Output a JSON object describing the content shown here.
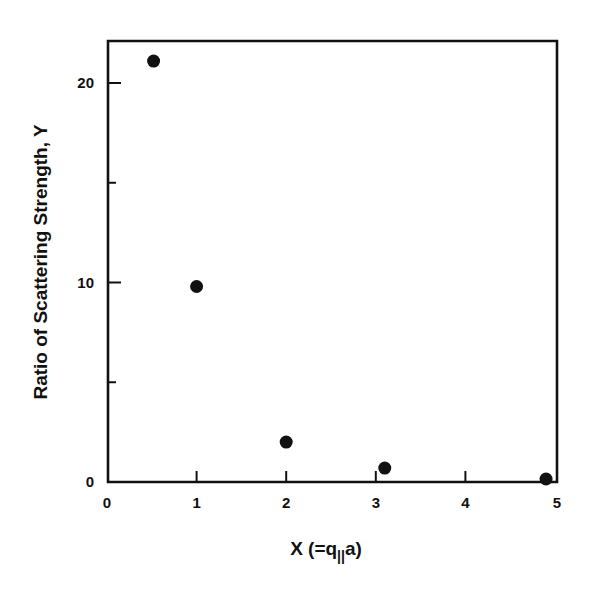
{
  "chart_data": {
    "type": "scatter",
    "title": "",
    "xlabel": "X (=q||a)",
    "xlabel_parts": {
      "main": "X (=q",
      "subscript": "||",
      "tail": "a)"
    },
    "ylabel": "Ratio of Scattering Strength, Y",
    "xlim": [
      0,
      5
    ],
    "ylim": [
      0,
      22
    ],
    "x_ticks": [
      0,
      1,
      2,
      3,
      4,
      5
    ],
    "x_tick_labels": [
      "0",
      "1",
      "2",
      "3",
      "4",
      "5"
    ],
    "y_ticks": [
      0,
      10,
      20
    ],
    "y_tick_labels": [
      "0",
      "10",
      "20"
    ],
    "y_minor_ticks": [
      5,
      15
    ],
    "grid": false,
    "legend": null,
    "marker": "filled-circle",
    "series": [
      {
        "name": "Y",
        "x": [
          0.52,
          1.0,
          2.0,
          3.1,
          4.9
        ],
        "y": [
          21.1,
          9.8,
          2.0,
          0.7,
          0.15
        ]
      }
    ]
  },
  "colors": {
    "ink": "#111111",
    "background": "#ffffff"
  }
}
